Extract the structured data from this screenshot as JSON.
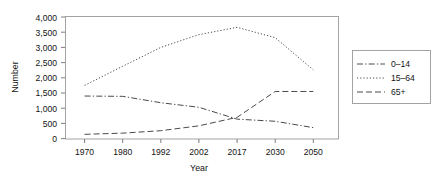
{
  "chart_data": {
    "type": "line",
    "title": "",
    "xlabel": "Year",
    "ylabel": "Number",
    "categories": [
      "1970",
      "1980",
      "1992",
      "2002",
      "2017",
      "2030",
      "2050"
    ],
    "ylim": [
      0,
      4000
    ],
    "yticks": [
      "0",
      "500",
      "1,000",
      "1,500",
      "2,000",
      "2,500",
      "3,000",
      "3,500",
      "4,000"
    ],
    "ytick_values": [
      0,
      500,
      1000,
      1500,
      2000,
      2500,
      3000,
      3500,
      4000
    ],
    "grid": false,
    "legend_position": "right",
    "series": [
      {
        "name": "0–14",
        "style": "dash-dot",
        "color": "#4a4a4a",
        "values": [
          1400,
          1390,
          1180,
          1030,
          640,
          570,
          360
        ]
      },
      {
        "name": "15–64",
        "style": "dotted",
        "color": "#4a4a4a",
        "values": [
          1750,
          2380,
          3000,
          3420,
          3660,
          3320,
          2260
        ]
      },
      {
        "name": "65+",
        "style": "dashed",
        "color": "#4a4a4a",
        "values": [
          140,
          180,
          260,
          420,
          700,
          1550,
          1550
        ]
      }
    ]
  },
  "axes": {
    "y_title": "Number",
    "x_title": "Year"
  },
  "legend": {
    "entries": [
      {
        "label": "0–14"
      },
      {
        "label": "15–64"
      },
      {
        "label": "65+"
      }
    ]
  }
}
